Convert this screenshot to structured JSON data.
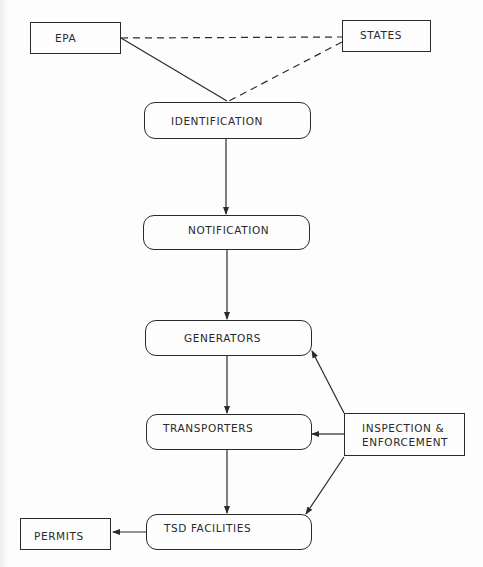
{
  "diagram": {
    "nodes": {
      "epa": {
        "label": "EPA",
        "shape": "rectangle"
      },
      "states": {
        "label": "STATES",
        "shape": "rectangle"
      },
      "identification": {
        "label": "IDENTIFICATION",
        "shape": "rounded-rectangle"
      },
      "notification": {
        "label": "NOTIFICATION",
        "shape": "rounded-rectangle"
      },
      "generators": {
        "label": "GENERATORS",
        "shape": "rounded-rectangle"
      },
      "transporters": {
        "label": "TRANSPORTERS",
        "shape": "rounded-rectangle"
      },
      "tsd_facilities": {
        "label": "TSD FACILITIES",
        "shape": "rounded-rectangle"
      },
      "inspection_enforcement": {
        "label_line1": "INSPECTION &",
        "label_line2": "ENFORCEMENT",
        "shape": "rectangle"
      },
      "permits": {
        "label": "PERMITS",
        "shape": "rectangle"
      }
    },
    "edges": [
      {
        "from": "EPA",
        "to": "STATES",
        "style": "dashed",
        "arrow": false
      },
      {
        "from": "EPA",
        "to": "IDENTIFICATION",
        "style": "solid",
        "arrow": false
      },
      {
        "from": "STATES",
        "to": "IDENTIFICATION",
        "style": "dashed",
        "arrow": false
      },
      {
        "from": "IDENTIFICATION",
        "to": "NOTIFICATION",
        "style": "solid",
        "arrow": true
      },
      {
        "from": "NOTIFICATION",
        "to": "GENERATORS",
        "style": "solid",
        "arrow": true
      },
      {
        "from": "GENERATORS",
        "to": "TRANSPORTERS",
        "style": "solid",
        "arrow": true
      },
      {
        "from": "TRANSPORTERS",
        "to": "TSD FACILITIES",
        "style": "solid",
        "arrow": true
      },
      {
        "from": "INSPECTION & ENFORCEMENT",
        "to": "GENERATORS",
        "style": "solid",
        "arrow": true
      },
      {
        "from": "INSPECTION & ENFORCEMENT",
        "to": "TRANSPORTERS",
        "style": "solid",
        "arrow": true
      },
      {
        "from": "INSPECTION & ENFORCEMENT",
        "to": "TSD FACILITIES",
        "style": "solid",
        "arrow": true
      },
      {
        "from": "TSD FACILITIES",
        "to": "PERMITS",
        "style": "solid",
        "arrow": true
      }
    ],
    "colors": {
      "stroke": "#2a2a2a",
      "background": "#fdfdfd"
    }
  }
}
